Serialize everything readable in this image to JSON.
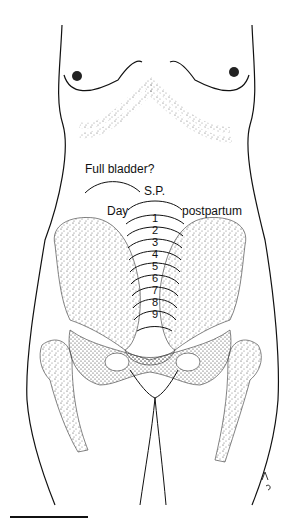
{
  "figure": {
    "labels": {
      "full_bladder": "Full bladder?",
      "symphysis": "S.P.",
      "day": "Day",
      "postpartum": "postpartum"
    },
    "day_markers": [
      "1",
      "2",
      "3",
      "4",
      "5",
      "6",
      "7",
      "8",
      "9"
    ],
    "signature": "artist-monogram",
    "colors": {
      "ink": "#111111",
      "stipple": "#555555",
      "background": "#ffffff"
    }
  }
}
